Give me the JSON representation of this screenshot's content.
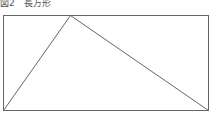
{
  "caption": "図2　長方形",
  "figure": {
    "stroke_color": "#666666",
    "rectangle": {
      "x": 3,
      "y": 15,
      "width": 205,
      "height": 95
    },
    "triangle": {
      "vertices": [
        {
          "x": 3,
          "y": 110
        },
        {
          "x": 70,
          "y": 15
        },
        {
          "x": 208,
          "y": 110
        }
      ]
    }
  }
}
